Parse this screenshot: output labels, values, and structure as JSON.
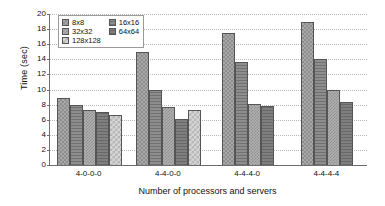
{
  "chart_data": {
    "type": "bar",
    "title": "",
    "xlabel": "Number of processors and servers",
    "ylabel": "Time (sec)",
    "categories": [
      "4-0-0-0",
      "4-4-0-0",
      "4-4-4-0",
      "4-4-4-4"
    ],
    "ylim": [
      0,
      20
    ],
    "ytick_labels": [
      "0",
      "2",
      "4",
      "6",
      "8",
      "10",
      "12",
      "14",
      "16",
      "18",
      "20"
    ],
    "yticks": [
      0,
      2,
      4,
      6,
      8,
      10,
      12,
      14,
      16,
      18,
      20
    ],
    "grid": true,
    "legend_position": "upper-left-inside",
    "series": [
      {
        "name": "8x8",
        "values": [
          8.9,
          15.0,
          17.5,
          18.9
        ]
      },
      {
        "name": "16x16",
        "values": [
          8.0,
          10.0,
          13.6,
          14.1
        ]
      },
      {
        "name": "32x32",
        "values": [
          7.3,
          7.7,
          8.1,
          10.0
        ]
      },
      {
        "name": "64x64",
        "values": [
          7.0,
          6.1,
          7.8,
          8.4
        ]
      },
      {
        "name": "128x128",
        "values": [
          6.6,
          7.3,
          null,
          null
        ]
      }
    ],
    "legend": [
      {
        "label": "8x8",
        "pattern": "p-8x8"
      },
      {
        "label": "16x16",
        "pattern": "p-16x16"
      },
      {
        "label": "32x32",
        "pattern": "p-32x32"
      },
      {
        "label": "64x64",
        "pattern": "p-64x64"
      },
      {
        "label": "128x128",
        "pattern": "p-128x128"
      }
    ],
    "colors": {
      "8x8": "#a8a8a8",
      "16x16": "#8d8d8d",
      "32x32": "#b0b0b0",
      "64x64": "#7f7f7f",
      "128x128": "#d6d6d6",
      "axis": "#6d6d6d",
      "gridline": "#b9b9b9",
      "background": "#ffffff"
    }
  }
}
